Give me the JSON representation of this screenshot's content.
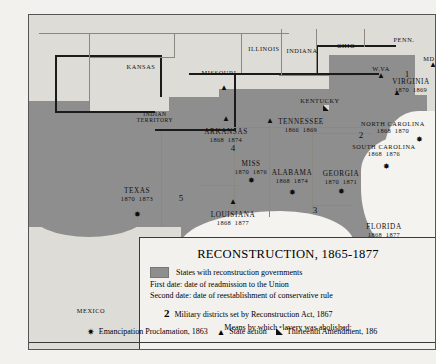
{
  "map": {
    "title": "RECONSTRUCTION, 1865-1877",
    "shade_color": "#8e8e8e",
    "land_color": "#dedcd7",
    "legend": {
      "swatch_label": "States with reconstruction governments",
      "first_date": "First date: date of readmission to the Union",
      "second_date": "Second date: date of reestablishment of conservative rule",
      "military_number": "2",
      "military_label": "Military districts set by Reconstruction Act, 1867",
      "means_heading": "Means by which slavery was abolished:",
      "symbols": [
        {
          "glyph": "star",
          "label": "Emancipation Proclamation, 1863"
        },
        {
          "glyph": "triangle",
          "label": "State action"
        },
        {
          "glyph": "square",
          "label": "Thirteenth Amendment, 186"
        }
      ]
    },
    "reconstruction_states": [
      {
        "name": "TEXAS",
        "readmitted": "1870",
        "redeemed": "1873",
        "x": 108,
        "y": 172,
        "symbol": "star",
        "sym_x": 108,
        "sym_y": 200
      },
      {
        "name": "ARKANSAS",
        "readmitted": "1868",
        "redeemed": "1874",
        "x": 197,
        "y": 113,
        "symbol": "triangle",
        "sym_x": 197,
        "sym_y": 104
      },
      {
        "name": "LOUISIANA",
        "readmitted": "1868",
        "redeemed": "1877",
        "x": 204,
        "y": 196,
        "symbol": "triangle",
        "sym_x": 204,
        "sym_y": 187
      },
      {
        "name": "MISS",
        "readmitted": "1870",
        "redeemed": "1876",
        "x": 222,
        "y": 145,
        "symbol": "star",
        "sym_x": 222,
        "sym_y": 166
      },
      {
        "name": "ALABAMA",
        "readmitted": "1868",
        "redeemed": "1874",
        "x": 263,
        "y": 154,
        "symbol": "star",
        "sym_x": 263,
        "sym_y": 178
      },
      {
        "name": "GEORGIA",
        "readmitted": "1870",
        "redeemed": "1871",
        "x": 312,
        "y": 155,
        "symbol": "star",
        "sym_x": 312,
        "sym_y": 177
      },
      {
        "name": "FLORIDA",
        "readmitted": "1868",
        "redeemed": "1877",
        "x": 355,
        "y": 208,
        "symbol": "star",
        "sym_x": 349,
        "sym_y": 227
      },
      {
        "name": "SOUTH CAROLINA",
        "readmitted": "1868",
        "redeemed": "1876",
        "x": 355,
        "y": 128,
        "symbol": "star",
        "sym_x": 357,
        "sym_y": 152
      },
      {
        "name": "NORTH CAROLINA",
        "readmitted": "1868",
        "redeemed": "1870",
        "x": 364,
        "y": 105,
        "symbol": "star",
        "sym_x": 390,
        "sym_y": 125
      },
      {
        "name": "TENNESSEE",
        "readmitted": "1866",
        "redeemed": "1869",
        "x": 272,
        "y": 103,
        "symbol": "triangle",
        "sym_x": 241,
        "sym_y": 106
      },
      {
        "name": "VIRGINIA",
        "readmitted": "1870",
        "redeemed": "1869",
        "x": 382,
        "y": 63,
        "symbol": "triangle",
        "sym_x": 368,
        "sym_y": 78
      }
    ],
    "other_places": [
      {
        "name": "KANSAS",
        "x": 112,
        "y": 48
      },
      {
        "name": "MISSOURI",
        "x": 190,
        "y": 54,
        "symbol": "triangle",
        "sym_x": 195,
        "sym_y": 73
      },
      {
        "name": "ILLINOIS",
        "x": 235,
        "y": 30
      },
      {
        "name": "INDIANA",
        "x": 273,
        "y": 32
      },
      {
        "name": "OHIO",
        "x": 317,
        "y": 27
      },
      {
        "name": "PENN.",
        "x": 375,
        "y": 21
      },
      {
        "name": "KENTUCKY",
        "x": 291,
        "y": 82,
        "symbol": "square",
        "sym_x": 297,
        "sym_y": 93
      },
      {
        "name": "W.VA",
        "x": 352,
        "y": 50,
        "symbol": "triangle",
        "sym_x": 352,
        "sym_y": 61
      },
      {
        "name": "MD",
        "x": 400,
        "y": 40,
        "symbol": "triangle",
        "sym_x": 404,
        "sym_y": 50
      },
      {
        "name": "INDIAN TERRITORY",
        "x": 126,
        "y": 96
      },
      {
        "name": "MEXICO",
        "x": 62,
        "y": 292
      }
    ],
    "military_districts": [
      {
        "number": "1",
        "x": 378,
        "y": 54
      },
      {
        "number": "2",
        "x": 332,
        "y": 115
      },
      {
        "number": "3",
        "x": 286,
        "y": 190
      },
      {
        "number": "4",
        "x": 204,
        "y": 128
      },
      {
        "number": "5",
        "x": 152,
        "y": 178
      }
    ]
  }
}
